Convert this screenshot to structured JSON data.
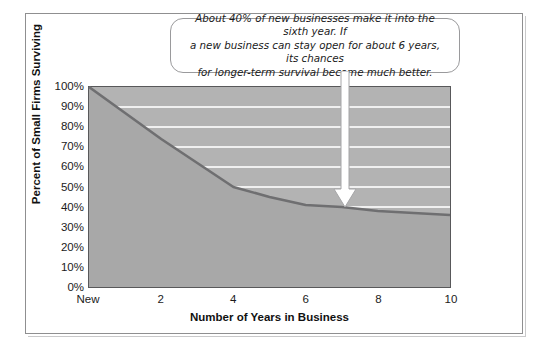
{
  "chart_data": {
    "type": "area",
    "title": "",
    "subtitle": "",
    "xlabel": "Number of Years in Business",
    "ylabel": "Percent of Small Firms Surviving",
    "x": [
      0,
      1,
      2,
      3,
      4,
      5,
      6,
      7,
      8,
      9,
      10
    ],
    "x_tick_labels": [
      "New",
      "2",
      "4",
      "6",
      "8",
      "10"
    ],
    "x_tick_values": [
      0,
      2,
      4,
      6,
      8,
      10
    ],
    "y_tick_labels": [
      "100%",
      "90%",
      "80%",
      "70%",
      "60%",
      "50%",
      "40%",
      "30%",
      "20%",
      "10%",
      "0%"
    ],
    "y_tick_values": [
      100,
      90,
      80,
      70,
      60,
      50,
      40,
      30,
      20,
      10,
      0
    ],
    "xlim": [
      0,
      10
    ],
    "ylim": [
      0,
      100
    ],
    "grid": "horizontal",
    "legend": "none",
    "series": [
      {
        "name": "Percent of Small Firms Surviving",
        "values": [
          100,
          87,
          74,
          62,
          50,
          45,
          41,
          40,
          38,
          37,
          36
        ]
      }
    ],
    "annotations": [
      {
        "text": "About 40% of new businesses make it into the sixth year. If a new business can stay open for about 6 years, its chances for longer-term survival become much better.",
        "points_to_x": 6,
        "points_to_y": 41
      }
    ]
  },
  "axes": {
    "y_label": "Percent of Small Firms Surviving",
    "x_label": "Number of Years in Business",
    "y_ticks": [
      "100%",
      "90%",
      "80%",
      "70%",
      "60%",
      "50%",
      "40%",
      "30%",
      "20%",
      "10%",
      "0%"
    ],
    "x_ticks": [
      "New",
      "2",
      "4",
      "6",
      "8",
      "10"
    ]
  },
  "callout": {
    "text": "About 40% of new businesses make it into the sixth year. If\na new business can stay open for about 6 years, its chances\nfor longer-term survival become much better."
  },
  "colors": {
    "plot_background": "#b3b3b3",
    "area_fill": "#a8a8a8",
    "line": "#6f6f71",
    "gridline": "#f0f0f0",
    "axis": "#58585a",
    "frame": "#8f8f90",
    "text": "#1b1b1b",
    "callout_background": "#ffffff",
    "arrow_fill": "#ffffff"
  }
}
